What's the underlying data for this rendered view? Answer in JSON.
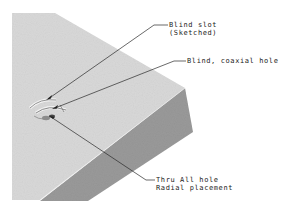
{
  "figure": {
    "colors": {
      "background": "#ffffff",
      "top_face": "#d9d9d9",
      "side_face": "#9a9a9a",
      "leader": "#2a2a2a",
      "feature": "#6e6e6e"
    },
    "callouts": [
      {
        "id": "blind-slot",
        "lines": [
          "Blind slot",
          "(Sketched)"
        ]
      },
      {
        "id": "coaxial-hole",
        "lines": [
          "Blind, coaxial hole"
        ]
      },
      {
        "id": "thru-all-hole",
        "lines": [
          "Thru All hole",
          "Radial placement"
        ]
      }
    ]
  }
}
